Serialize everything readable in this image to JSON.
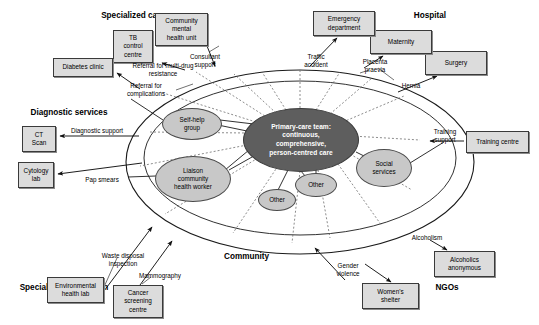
{
  "diagram": {
    "section_labels": [
      {
        "id": "specialized-care",
        "text": "Specialized care",
        "x": 78,
        "y": 11,
        "w": 110
      },
      {
        "id": "hospital",
        "text": "Hospital",
        "x": 400,
        "y": 11,
        "w": 60
      },
      {
        "id": "diagnostic-services",
        "text": "Diagnostic services",
        "x": 14,
        "y": 108,
        "w": 110
      },
      {
        "id": "ngos",
        "text": "NGOs",
        "x": 425,
        "y": 283,
        "w": 44
      },
      {
        "id": "specialized-prevention",
        "text": "Specialized prevention services",
        "x": 12,
        "y": 283,
        "w": 104,
        "wrap": true
      }
    ],
    "community_label": {
      "text": "Community",
      "x": 224,
      "y": 252
    },
    "center": {
      "lines": [
        "Primary-care team:",
        "continuous,",
        "comprehensive,",
        "person-centred care"
      ],
      "cx": 300,
      "cy": 139,
      "rx": 57,
      "ry": 31,
      "fill": "#5e5e5e",
      "text_color": "#ffffff"
    },
    "satellites": [
      {
        "id": "self-help-group",
        "text": "Self-help\ngroup",
        "cx": 191,
        "cy": 123,
        "rx": 29,
        "ry": 15
      },
      {
        "id": "liaison-community-health-worker",
        "text": "Liaison\ncommunity\nhealth worker",
        "cx": 192,
        "cy": 178,
        "rx": 37,
        "ry": 22
      },
      {
        "id": "social-services",
        "text": "Social\nservices",
        "cx": 383,
        "cy": 167,
        "rx": 27,
        "ry": 18
      },
      {
        "id": "other-lower-mid",
        "text": "Other",
        "cx": 315,
        "cy": 184,
        "rx": 20,
        "ry": 11
      },
      {
        "id": "other-lower-left",
        "text": "Other",
        "cx": 276,
        "cy": 199,
        "rx": 18,
        "ry": 10
      }
    ],
    "boxes": [
      {
        "id": "tb-control-centre",
        "text": "TB\ncontrol\ncentre",
        "x": 113,
        "y": 30,
        "w": 40,
        "h": 33
      },
      {
        "id": "community-mental-health-unit",
        "text": "Community\nmental\nhealth unit",
        "x": 155,
        "y": 13,
        "w": 53,
        "h": 33
      },
      {
        "id": "diabetes-clinic",
        "text": "Diabetes clinic",
        "x": 53,
        "y": 58,
        "w": 60,
        "h": 19
      },
      {
        "id": "ct-scan",
        "text": "CT\nScan",
        "x": 22,
        "y": 126,
        "w": 34,
        "h": 26
      },
      {
        "id": "cytology-lab",
        "text": "Cytology\nlab",
        "x": 18,
        "y": 162,
        "w": 36,
        "h": 26
      },
      {
        "id": "environmental-health-lab",
        "text": "Environmental\nhealth lab",
        "x": 47,
        "y": 277,
        "w": 57,
        "h": 26
      },
      {
        "id": "cancer-screening-centre",
        "text": "Cancer\nscreening\ncentre",
        "x": 113,
        "y": 285,
        "w": 50,
        "h": 33
      },
      {
        "id": "emergency-department",
        "text": "Emergency\ndepartment",
        "x": 313,
        "y": 11,
        "w": 62,
        "h": 25
      },
      {
        "id": "maternity",
        "text": "Maternity",
        "x": 370,
        "y": 30,
        "w": 62,
        "h": 24
      },
      {
        "id": "surgery",
        "text": "Surgery",
        "x": 425,
        "y": 51,
        "w": 62,
        "h": 24
      },
      {
        "id": "training-centre",
        "text": "Training centre",
        "x": 466,
        "y": 131,
        "w": 63,
        "h": 22
      },
      {
        "id": "alcoholics-anonymous",
        "text": "Alcoholics\nanonymous",
        "x": 434,
        "y": 251,
        "w": 61,
        "h": 26
      },
      {
        "id": "womens-shelter",
        "text": "Women's\nshelter",
        "x": 362,
        "y": 283,
        "w": 57,
        "h": 26
      }
    ],
    "edge_labels": [
      {
        "id": "referral-multidrug",
        "text": "Referral for\nmulti-drug resistance",
        "x": 126,
        "y": 62,
        "w": 74
      },
      {
        "id": "referral-complications",
        "text": "Referral for\ncomplications",
        "x": 117,
        "y": 82,
        "w": 58
      },
      {
        "id": "consultant-support",
        "text": "Consultant\nsupport",
        "x": 183,
        "y": 53,
        "w": 44
      },
      {
        "id": "diagnostic-support",
        "text": "Diagnostic support",
        "x": 62,
        "y": 127,
        "w": 70
      },
      {
        "id": "pap-smears",
        "text": "Pap smears",
        "x": 78,
        "y": 176,
        "w": 48
      },
      {
        "id": "waste-disposal",
        "text": "Waste disposal\ninspection",
        "x": 92,
        "y": 252,
        "w": 62
      },
      {
        "id": "mammography",
        "text": "Mammography",
        "x": 131,
        "y": 272,
        "w": 58
      },
      {
        "id": "traffic-accident",
        "text": "Traffic\naccident",
        "x": 297,
        "y": 53,
        "w": 38
      },
      {
        "id": "placenta-praevia",
        "text": "Placenta\npraevia",
        "x": 356,
        "y": 58,
        "w": 38
      },
      {
        "id": "hernia",
        "text": "Hernia",
        "x": 396,
        "y": 82,
        "w": 30
      },
      {
        "id": "training-support",
        "text": "Training\nsupport",
        "x": 427,
        "y": 128,
        "w": 36
      },
      {
        "id": "alcoholism",
        "text": "Alcoholism",
        "x": 405,
        "y": 234,
        "w": 44
      },
      {
        "id": "gender-violence",
        "text": "Gender\nviolence",
        "x": 330,
        "y": 262,
        "w": 36
      }
    ],
    "rings": [
      {
        "id": "outer-community-ellipse",
        "cx": 300,
        "cy": 162,
        "rx": 174,
        "ry": 92
      },
      {
        "id": "inner-ring-ellipse",
        "cx": 300,
        "cy": 158,
        "rx": 156,
        "ry": 77
      }
    ],
    "colors": {
      "box_fill": "#dcdcdc",
      "box_stroke": "#3a3a3a",
      "ellipse_fill": "#c8c8c8",
      "ellipse_stroke": "#4a4a4a",
      "center_fill": "#5e5e5e",
      "line": "#1a1a1a",
      "dash": "#555555"
    }
  }
}
